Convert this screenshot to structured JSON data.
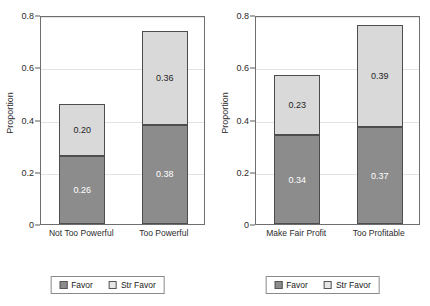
{
  "chart_data": {
    "type": "bar",
    "title": "",
    "xlabel": "",
    "ylabel": "Proportion",
    "ylim": [
      0,
      0.8
    ],
    "yticks": [
      "0",
      "0.2",
      "0.4",
      "0.6",
      "0.8"
    ],
    "ytick_values": [
      0,
      0.2,
      0.4,
      0.6,
      0.8
    ],
    "grid": true,
    "stacked": true,
    "legend_position": "bottom",
    "series": [
      {
        "name": "Favor",
        "color": "#8c8c8c"
      },
      {
        "name": "Str Favor",
        "color": "#d9d9d9"
      }
    ],
    "panels": [
      {
        "name": "power-panel",
        "categories": [
          "Not Too Powerful",
          "Too Powerful"
        ],
        "bars": [
          {
            "category": "Not Too Powerful",
            "favor": 0.26,
            "str_favor": 0.2,
            "total": 0.46,
            "favor_label": "0.26",
            "str_favor_label": "0.20"
          },
          {
            "category": "Too Powerful",
            "favor": 0.38,
            "str_favor": 0.36,
            "total": 0.74,
            "favor_label": "0.38",
            "str_favor_label": "0.36"
          }
        ],
        "legend": [
          {
            "label": "Favor",
            "color": "#8c8c8c"
          },
          {
            "label": "Str Favor",
            "color": "#e6e6e6"
          }
        ]
      },
      {
        "name": "profit-panel",
        "categories": [
          "Make Fair Profit",
          "Too Profitable"
        ],
        "bars": [
          {
            "category": "Make Fair Profit",
            "favor": 0.34,
            "str_favor": 0.23,
            "total": 0.57,
            "favor_label": "0.34",
            "str_favor_label": "0.23"
          },
          {
            "category": "Too Profitable",
            "favor": 0.37,
            "str_favor": 0.39,
            "total": 0.76,
            "favor_label": "0.37",
            "str_favor_label": "0.39"
          }
        ],
        "legend": [
          {
            "label": "Favor",
            "color": "#8c8c8c"
          },
          {
            "label": "Str Favor",
            "color": "#e6e6e6"
          }
        ]
      }
    ]
  }
}
